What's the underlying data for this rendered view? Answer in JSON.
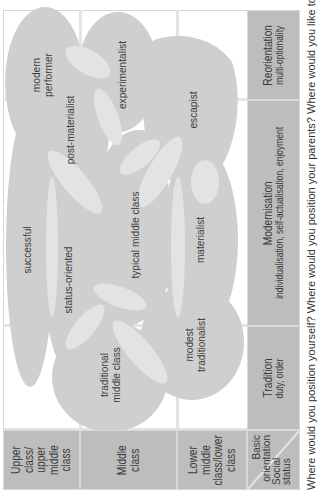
{
  "rows": [
    {
      "label": "Upper class/ upper middle class",
      "lines": [
        "Upper class/",
        "upper",
        "middle class"
      ]
    },
    {
      "label": "Middle class",
      "lines": [
        "Middle",
        "class"
      ]
    },
    {
      "label": "Lower middle class/lower class",
      "lines": [
        "Lower middle",
        "class/lower",
        "class"
      ]
    }
  ],
  "corner": {
    "social_status": [
      "Social",
      "status"
    ],
    "basic_orientation": [
      "Basic",
      "orientation"
    ]
  },
  "columns": [
    {
      "title": "Tradition",
      "subtitle": "duty, order"
    },
    {
      "title": "Modernisation",
      "subtitle": "individualisation, self-actualisation, enjoyment"
    },
    {
      "title": "Reorientation",
      "subtitle": "multi-optionality"
    }
  ],
  "milieus": [
    {
      "name": "modern performer",
      "lines": [
        "modern",
        "performer"
      ]
    },
    {
      "name": "experimentalist",
      "lines": [
        "experimentalist"
      ]
    },
    {
      "name": "escapist",
      "lines": [
        "escapist"
      ]
    },
    {
      "name": "post-materialist",
      "lines": [
        "post-materialist"
      ]
    },
    {
      "name": "typical middle class",
      "lines": [
        "typical middle class"
      ]
    },
    {
      "name": "successful",
      "lines": [
        "successful"
      ]
    },
    {
      "name": "status-oriented",
      "lines": [
        "status-oriented"
      ]
    },
    {
      "name": "materialist",
      "lines": [
        "materialist"
      ]
    },
    {
      "name": "modest traditionalist",
      "lines": [
        "modest",
        "traditionalist"
      ]
    },
    {
      "name": "traditional middle class",
      "lines": [
        "traditional",
        "middle class"
      ]
    }
  ],
  "caption": "Where would you position yourself? Where would you position your parents? Where would you like to be positioned",
  "colors": {
    "blob": "#cfcfcf",
    "overlap": "#e3e3e3",
    "header": "#bdbdbd",
    "grid": "#e4e4e4"
  }
}
